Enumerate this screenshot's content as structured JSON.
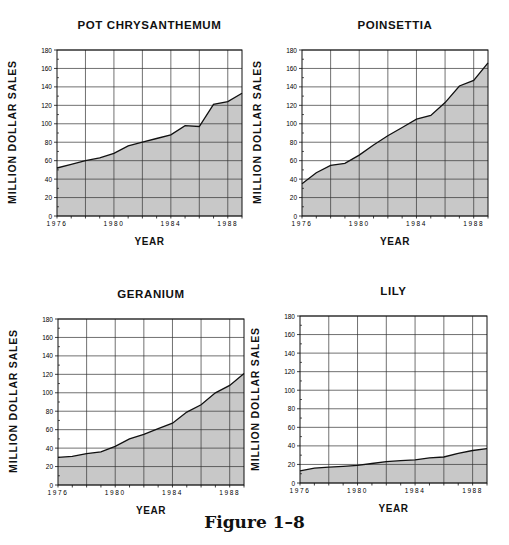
{
  "figure": {
    "caption": "Figure 1–8"
  },
  "layout": {
    "panels": [
      {
        "key": "pot_chrysanthemum",
        "plot": {
          "left": 57,
          "top": 50,
          "right": 242,
          "bottom": 216
        }
      },
      {
        "key": "poinsettia",
        "plot": {
          "left": 302,
          "top": 50,
          "right": 488,
          "bottom": 216
        }
      },
      {
        "key": "geranium",
        "plot": {
          "left": 58,
          "top": 319,
          "right": 244,
          "bottom": 485
        }
      },
      {
        "key": "lily",
        "plot": {
          "left": 300,
          "top": 316,
          "right": 487,
          "bottom": 483
        }
      }
    ],
    "fill_color": "#c8c8c8",
    "line_color": "#111111",
    "grid_color": "#333333"
  },
  "chart_data": [
    {
      "type": "area",
      "title": "POT CHRYSANTHEMUM",
      "xlabel": "YEAR",
      "ylabel": "MILLION DOLLAR SALES",
      "x": [
        1976,
        1977,
        1978,
        1979,
        1980,
        1981,
        1982,
        1983,
        1984,
        1985,
        1986,
        1987,
        1988,
        1989
      ],
      "values": [
        52,
        56,
        60,
        63,
        68,
        76,
        80,
        84,
        88,
        98,
        97,
        121,
        124,
        133
      ],
      "xlim": [
        1976,
        1989
      ],
      "ylim": [
        0,
        180
      ],
      "xticks": [
        1976,
        1980,
        1984,
        1988
      ],
      "yticks": [
        0,
        20,
        40,
        60,
        80,
        100,
        120,
        140,
        160,
        180
      ],
      "grid": true
    },
    {
      "type": "area",
      "title": "POINSETTIA",
      "xlabel": "YEAR",
      "ylabel": "MILLION DOLLAR SALES",
      "x": [
        1976,
        1977,
        1978,
        1979,
        1980,
        1981,
        1982,
        1983,
        1984,
        1985,
        1986,
        1987,
        1988,
        1989
      ],
      "values": [
        35,
        47,
        55,
        57,
        66,
        77,
        87,
        96,
        105,
        109,
        123,
        141,
        147,
        166
      ],
      "xlim": [
        1976,
        1989
      ],
      "ylim": [
        0,
        180
      ],
      "xticks": [
        1976,
        1980,
        1984,
        1988
      ],
      "yticks": [
        0,
        20,
        40,
        60,
        80,
        100,
        120,
        140,
        160,
        180
      ],
      "grid": true
    },
    {
      "type": "area",
      "title": "GERANIUM",
      "xlabel": "YEAR",
      "ylabel": "MILLION DOLLAR SALES",
      "x": [
        1976,
        1977,
        1978,
        1979,
        1980,
        1981,
        1982,
        1983,
        1984,
        1985,
        1986,
        1987,
        1988,
        1989
      ],
      "values": [
        30,
        31,
        34,
        36,
        42,
        50,
        55,
        61,
        67,
        79,
        87,
        100,
        108,
        121
      ],
      "xlim": [
        1976,
        1989
      ],
      "ylim": [
        0,
        180
      ],
      "xticks": [
        1976,
        1980,
        1984,
        1988
      ],
      "yticks": [
        0,
        20,
        40,
        60,
        80,
        100,
        120,
        140,
        160,
        180
      ],
      "grid": true
    },
    {
      "type": "area",
      "title": "LILY",
      "xlabel": "YEAR",
      "ylabel": "MILLION DOLLAR SALES",
      "x": [
        1976,
        1977,
        1978,
        1979,
        1980,
        1981,
        1982,
        1983,
        1984,
        1985,
        1986,
        1987,
        1988,
        1989
      ],
      "values": [
        13,
        16,
        17,
        18,
        19,
        21,
        23,
        24,
        25,
        27,
        28,
        32,
        35,
        37
      ],
      "xlim": [
        1976,
        1989
      ],
      "ylim": [
        0,
        180
      ],
      "xticks": [
        1976,
        1980,
        1984,
        1988
      ],
      "yticks": [
        0,
        20,
        40,
        60,
        80,
        100,
        120,
        140,
        160,
        180
      ],
      "grid": true
    }
  ]
}
